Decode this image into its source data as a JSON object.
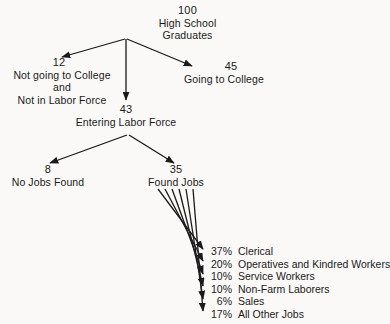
{
  "diagram": {
    "type": "flow-tree",
    "nodes": {
      "root": {
        "value": "100",
        "label_line1": "High School",
        "label_line2": "Graduates"
      },
      "not_college": {
        "value": "12",
        "label_line1": "Not going to College",
        "label_line2": "and",
        "label_line3": "Not in Labor Force"
      },
      "going_college": {
        "value": "45",
        "label_line1": "Going to College"
      },
      "entering_labor_force": {
        "value": "43",
        "label_line1": "Entering Labor Force"
      },
      "no_jobs_found": {
        "value": "8",
        "label_line1": "No Jobs Found"
      },
      "found_jobs": {
        "value": "35",
        "label_line1": "Found Jobs"
      }
    },
    "job_breakdown": [
      {
        "percent": "37%",
        "name": "Clerical"
      },
      {
        "percent": "20%",
        "name": "Operatives and Kindred Workers"
      },
      {
        "percent": "10%",
        "name": "Service Workers"
      },
      {
        "percent": "10%",
        "name": "Non-Farm Laborers"
      },
      {
        "percent": "6%",
        "name": "Sales"
      },
      {
        "percent": "17%",
        "name": "All Other Jobs"
      }
    ],
    "colors": {
      "background": "#faf9f7",
      "text": "#1a1a1a",
      "line": "#1a1a1a"
    }
  }
}
